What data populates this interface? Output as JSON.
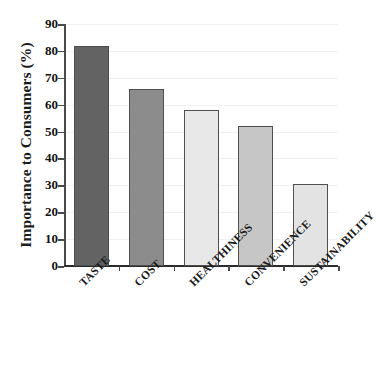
{
  "chart_data": {
    "type": "bar",
    "title": "",
    "subtitle": "",
    "xlabel": "",
    "ylabel": "Importance to Consumers (%)",
    "categories": [
      "TASTE",
      "COST",
      "HEALTHINESS",
      "CONVENIENCE",
      "SUSTAINABILITY"
    ],
    "values": [
      82,
      66,
      58,
      52,
      30.5
    ],
    "series": [
      {
        "name": "Importance to Consumers",
        "values": [
          82,
          66,
          58,
          52,
          30.5
        ]
      }
    ],
    "bar_colors": [
      "#636363",
      "#8c8c8c",
      "#e8e8e8",
      "#c6c6c6",
      "#e3e3e3"
    ],
    "bar_edge_color": "#4f4f4f",
    "ylim": [
      0,
      90
    ],
    "ytick_labels": [
      "0",
      "10",
      "20",
      "30",
      "40",
      "50",
      "60",
      "70",
      "80",
      "90"
    ],
    "ytick_values": [
      0,
      10,
      20,
      30,
      40,
      50,
      60,
      70,
      80,
      90
    ],
    "grid": "horizontal-faint",
    "grid_color": "#f1f1f1",
    "legend": "none",
    "xlabel_rotation": -45,
    "background_color": "#ffffff",
    "axis_color": "#2b2b2b",
    "text_color": "#1a1a1a"
  }
}
